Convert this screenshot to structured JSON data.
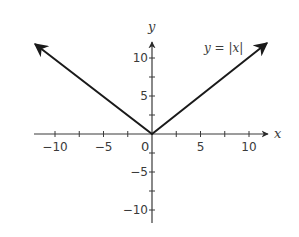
{
  "chart_data": {
    "type": "line",
    "title": "",
    "xlabel": "x",
    "ylabel": "y",
    "xlim": [
      -12,
      12
    ],
    "ylim": [
      -12,
      12
    ],
    "grid": false,
    "x_ticks": [
      -10,
      -5,
      5,
      10
    ],
    "x_tick_labels": [
      "−10",
      "−5",
      "5",
      "10"
    ],
    "y_ticks": [
      10,
      5,
      -5,
      -10
    ],
    "y_tick_labels": [
      "10",
      "5",
      "−5",
      "−10"
    ],
    "minor_tick_step": 2.5,
    "origin_label": "0",
    "series": [
      {
        "name": "y = |x|",
        "x": [
          -12,
          0,
          12
        ],
        "y": [
          12,
          0,
          12
        ],
        "arrows_both_ends": true
      }
    ],
    "annotations": [
      {
        "text": "y = |x|",
        "x": 8,
        "y": 11
      }
    ],
    "colors": {
      "line": "#1a1a1a",
      "axis": "#3a3a3a",
      "text": "#3a3a3a"
    }
  },
  "labels": {
    "x_axis": "x",
    "y_axis": "y",
    "function": "y = |x|",
    "origin": "0"
  }
}
